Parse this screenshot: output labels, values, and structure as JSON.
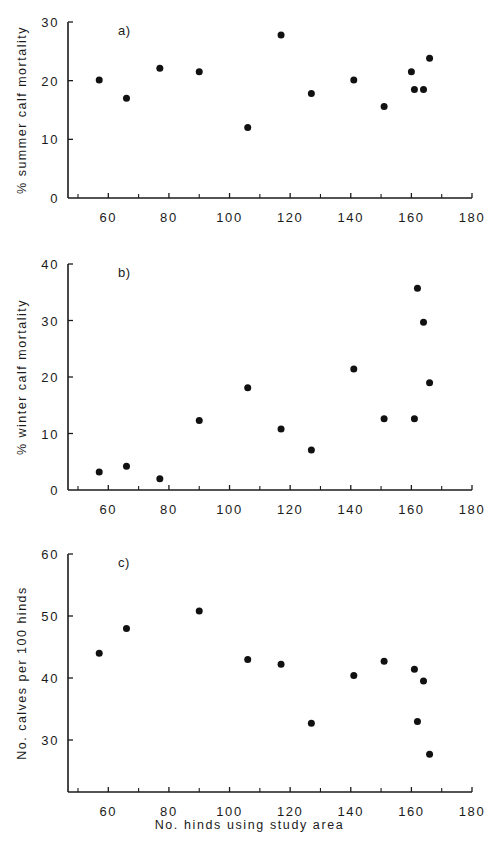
{
  "figure": {
    "xlabel": "No. hinds using study area",
    "shared_x": {
      "min": 50,
      "max": 180,
      "tick_step": 10,
      "labeled_ticks": [
        60,
        80,
        100,
        120,
        140,
        160,
        180
      ],
      "labels": [
        "60",
        "80",
        "100",
        "120",
        "140",
        "160",
        "180"
      ]
    }
  },
  "panels": [
    {
      "tag": "a)",
      "ylabel": "% summer calf mortality",
      "yticks": [
        0,
        10,
        20,
        30
      ],
      "ytick_labels": [
        "0",
        "10",
        "20",
        "30"
      ]
    },
    {
      "tag": "b)",
      "ylabel": "% winter calf mortality",
      "yticks": [
        0,
        10,
        20,
        30,
        40
      ],
      "ytick_labels": [
        "0",
        "10",
        "20",
        "30",
        "40"
      ]
    },
    {
      "tag": "c)",
      "ylabel": "No. calves per 100 hinds",
      "yticks": [
        30,
        40,
        50,
        60
      ],
      "ytick_labels": [
        "30",
        "40",
        "50",
        "60"
      ]
    }
  ],
  "chart_data": [
    {
      "type": "scatter",
      "title": "a)",
      "xlabel": "No. hinds using study area",
      "ylabel": "% summer calf mortality",
      "xlim": [
        50,
        180
      ],
      "ylim": [
        0,
        30
      ],
      "grid": false,
      "legend": "none",
      "marker": "filled-circle",
      "marker_color": "#111111",
      "points": [
        {
          "x": 57,
          "y": 20.1
        },
        {
          "x": 66,
          "y": 17.0
        },
        {
          "x": 77,
          "y": 22.1
        },
        {
          "x": 90,
          "y": 21.5
        },
        {
          "x": 106,
          "y": 12.0
        },
        {
          "x": 117,
          "y": 27.8
        },
        {
          "x": 127,
          "y": 17.8
        },
        {
          "x": 141,
          "y": 20.1
        },
        {
          "x": 151,
          "y": 15.6
        },
        {
          "x": 160,
          "y": 21.5
        },
        {
          "x": 161,
          "y": 18.5
        },
        {
          "x": 164,
          "y": 18.5
        },
        {
          "x": 166,
          "y": 23.8
        }
      ]
    },
    {
      "type": "scatter",
      "title": "b)",
      "xlabel": "No. hinds using study area",
      "ylabel": "% winter calf mortality",
      "xlim": [
        50,
        180
      ],
      "ylim": [
        0,
        40
      ],
      "grid": false,
      "legend": "none",
      "marker": "filled-circle",
      "marker_color": "#111111",
      "points": [
        {
          "x": 57,
          "y": 3.2
        },
        {
          "x": 66,
          "y": 4.2
        },
        {
          "x": 77,
          "y": 2.0
        },
        {
          "x": 90,
          "y": 12.3
        },
        {
          "x": 106,
          "y": 18.1
        },
        {
          "x": 117,
          "y": 10.8
        },
        {
          "x": 127,
          "y": 7.1
        },
        {
          "x": 141,
          "y": 21.4
        },
        {
          "x": 151,
          "y": 12.6
        },
        {
          "x": 161,
          "y": 12.6
        },
        {
          "x": 162,
          "y": 35.7
        },
        {
          "x": 164,
          "y": 29.7
        },
        {
          "x": 166,
          "y": 19.0
        }
      ]
    },
    {
      "type": "scatter",
      "title": "c)",
      "xlabel": "No. hinds using study area",
      "ylabel": "No. calves per 100 hinds",
      "xlim": [
        50,
        180
      ],
      "ylim": [
        25,
        60
      ],
      "grid": false,
      "legend": "none",
      "marker": "filled-circle",
      "marker_color": "#111111",
      "points": [
        {
          "x": 57,
          "y": 44.0
        },
        {
          "x": 66,
          "y": 48.0
        },
        {
          "x": 90,
          "y": 50.8
        },
        {
          "x": 106,
          "y": 43.0
        },
        {
          "x": 117,
          "y": 42.2
        },
        {
          "x": 127,
          "y": 32.7
        },
        {
          "x": 141,
          "y": 40.4
        },
        {
          "x": 151,
          "y": 42.7
        },
        {
          "x": 161,
          "y": 41.4
        },
        {
          "x": 162,
          "y": 33.0
        },
        {
          "x": 164,
          "y": 39.5
        },
        {
          "x": 166,
          "y": 27.7
        }
      ]
    }
  ]
}
